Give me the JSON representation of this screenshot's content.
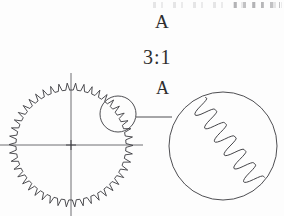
{
  "drawing": {
    "type": "mechanical-engineering-drawing",
    "subject": "spur gear with enlarged tooth detail",
    "background_color": "#fdfdfd",
    "line_color": "#3a3a3e",
    "callout": {
      "letter_top": "A",
      "scale_ratio": "3:1",
      "letter_bottom": "A"
    },
    "gear": {
      "center_x": 71,
      "center_y": 145,
      "tip_radius": 62,
      "root_radius": 55,
      "tooth_count": 46,
      "centerline_overhang": 10
    },
    "detail_circle": {
      "center_x": 118,
      "center_y": 114,
      "radius": 18
    },
    "detail_view": {
      "center_x": 223,
      "center_y": 146,
      "radius": 54,
      "magnified_tooth_count": 6
    },
    "leader_line": {
      "x1": 136,
      "y1": 117,
      "x2": 172,
      "y2": 117
    }
  }
}
